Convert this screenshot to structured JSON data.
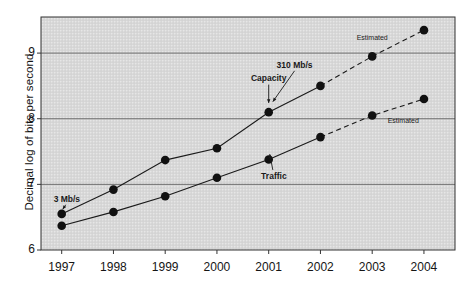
{
  "chart_data": {
    "type": "line",
    "title": "",
    "xlabel": "",
    "ylabel": "Decimal log of bits per second",
    "categories": [
      "1997",
      "1998",
      "1999",
      "2000",
      "2001",
      "2002",
      "2003",
      "2004"
    ],
    "x": [
      1997,
      1998,
      1999,
      2000,
      2001,
      2002,
      2003,
      2004
    ],
    "xlim": [
      1996.6,
      2004.6
    ],
    "ylim": [
      6,
      9.55
    ],
    "yticks": [
      6,
      7,
      8,
      9
    ],
    "ytick_labels": [
      "6",
      "7",
      "8",
      "9"
    ],
    "grid": "horizontal",
    "legend": "none",
    "series": [
      {
        "name": "Capacity",
        "values": [
          6.55,
          6.92,
          7.37,
          7.55,
          8.1,
          8.5,
          8.95,
          9.35
        ],
        "solid_through": 2002,
        "dashed_from": 2002,
        "marker": "filled-circle"
      },
      {
        "name": "Traffic",
        "values": [
          6.37,
          6.58,
          6.82,
          7.1,
          7.38,
          7.72,
          8.05,
          8.3
        ],
        "solid_through": 2002,
        "dashed_from": 2002,
        "marker": "filled-circle"
      }
    ],
    "annotations": [
      {
        "name": "capacity-label",
        "text": "Capacity",
        "x": 2001,
        "y": 8.62,
        "style": "bold"
      },
      {
        "name": "traffic-label",
        "text": "Traffic",
        "x": 2001.1,
        "y": 7.12,
        "style": "bold"
      },
      {
        "name": "rate-label-310",
        "text": "310 Mb/s",
        "x": 2001.5,
        "y": 8.82,
        "style": "bold"
      },
      {
        "name": "rate-label-3",
        "text": "3 Mb/s",
        "x": 1997.1,
        "y": 6.78,
        "style": "bold"
      },
      {
        "name": "estimated-label-upper",
        "text": "Estimated",
        "x": 2003.0,
        "y": 9.25,
        "style": "small"
      },
      {
        "name": "estimated-label-lower",
        "text": "Estimated",
        "x": 2003.6,
        "y": 7.98,
        "style": "small"
      }
    ]
  },
  "colors": {
    "plot_background": "#d7d7d7",
    "line": "#1a1a1a",
    "marker": "#111111",
    "gridline": "#555555",
    "axis": "#333333",
    "text": "#151515"
  }
}
